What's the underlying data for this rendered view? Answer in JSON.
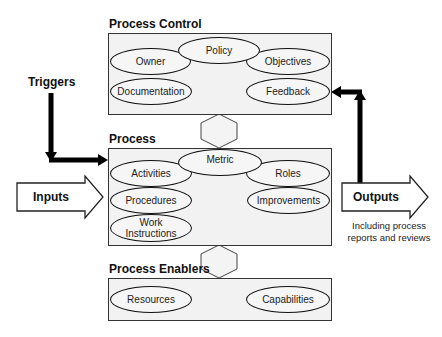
{
  "diagram": {
    "sections": {
      "control": {
        "title": "Process Control",
        "items": [
          "Policy",
          "Owner",
          "Objectives",
          "Documentation",
          "Feedback"
        ]
      },
      "process": {
        "title": "Process",
        "items": [
          "Metric",
          "Activities",
          "Roles",
          "Procedures",
          "Improvements",
          "Work",
          "Instructions"
        ]
      },
      "enablers": {
        "title": "Process Enablers",
        "items": [
          "Resources",
          "Capabilities"
        ]
      }
    },
    "triggers": {
      "label": "Triggers"
    },
    "inputs": {
      "label": "Inputs"
    },
    "outputs": {
      "label": "Outputs",
      "note_line1": "Including process",
      "note_line2": "reports and reviews"
    },
    "colors": {
      "box_fill": "#f2f2f2",
      "stroke": "#111111",
      "connector_fill": "#f4f4f4"
    }
  }
}
